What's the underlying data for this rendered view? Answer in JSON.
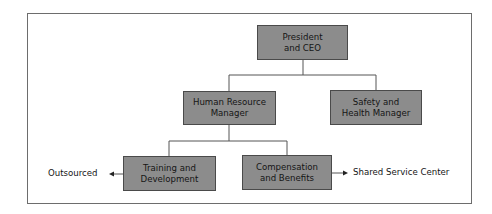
{
  "diagram": {
    "type": "org-chart",
    "nodes": {
      "ceo": {
        "label": "President\nand CEO",
        "line1": "President",
        "line2": "and CEO"
      },
      "hr": {
        "label": "Human Resource Manager",
        "line1": "Human Resource",
        "line2": "Manager"
      },
      "safety": {
        "label": "Safety and Health Manager",
        "line1": "Safety and",
        "line2": "Health Manager"
      },
      "training": {
        "label": "Training and Development",
        "line1": "Training and",
        "line2": "Development"
      },
      "comp": {
        "label": "Compensation and Benefits",
        "line1": "Compensation",
        "line2": "and Benefits"
      }
    },
    "external": {
      "outsourced": "Outsourced",
      "shared": "Shared Service Center"
    },
    "edges": [
      {
        "from": "ceo",
        "to": "hr"
      },
      {
        "from": "ceo",
        "to": "safety"
      },
      {
        "from": "hr",
        "to": "training"
      },
      {
        "from": "hr",
        "to": "comp"
      },
      {
        "from": "training",
        "to": "outsourced",
        "type": "arrow"
      },
      {
        "from": "comp",
        "to": "shared",
        "type": "arrow"
      }
    ],
    "colors": {
      "box_fill": "#8c8c8c",
      "box_border": "#4a4a4a",
      "line": "#555555"
    }
  }
}
